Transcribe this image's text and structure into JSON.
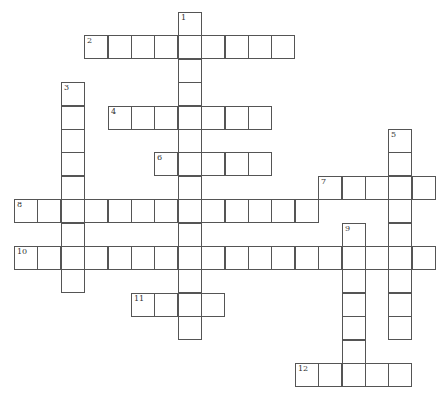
{
  "puzzle": {
    "type": "crossword",
    "cell_size": 23,
    "origin": {
      "x": 14,
      "y": 12
    },
    "colors": {
      "border": "#555555",
      "background": "#ffffff",
      "number": "#333333"
    },
    "entries": [
      {
        "number": 1,
        "direction": "down",
        "row": 0,
        "col": 7,
        "length": 14
      },
      {
        "number": 2,
        "direction": "across",
        "row": 1,
        "col": 3,
        "length": 9
      },
      {
        "number": 3,
        "direction": "down",
        "row": 3,
        "col": 2,
        "length": 9
      },
      {
        "number": 4,
        "direction": "across",
        "row": 4,
        "col": 4,
        "length": 7
      },
      {
        "number": 5,
        "direction": "down",
        "row": 5,
        "col": 16,
        "length": 9
      },
      {
        "number": 6,
        "direction": "across",
        "row": 6,
        "col": 6,
        "length": 5
      },
      {
        "number": 7,
        "direction": "across",
        "row": 7,
        "col": 13,
        "length": 5
      },
      {
        "number": 8,
        "direction": "across",
        "row": 8,
        "col": 0,
        "length": 13
      },
      {
        "number": 9,
        "direction": "down",
        "row": 9,
        "col": 14,
        "length": 7
      },
      {
        "number": 10,
        "direction": "across",
        "row": 10,
        "col": 0,
        "length": 18
      },
      {
        "number": 11,
        "direction": "across",
        "row": 12,
        "col": 5,
        "length": 4
      },
      {
        "number": 12,
        "direction": "across",
        "row": 15,
        "col": 12,
        "length": 5
      }
    ]
  }
}
